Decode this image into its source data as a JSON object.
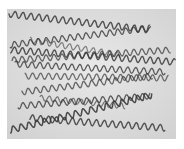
{
  "image": {
    "width": 184,
    "height": 149,
    "background": "#ffffff",
    "panel": {
      "x": 7,
      "y": 9,
      "w": 169,
      "h": 130,
      "fill": "#dcdcdc",
      "fill_light": "#e6e6e6"
    },
    "subject": "micrograph of helical spiral filaments",
    "filament_color": "#3a3a3a",
    "filaments": [
      {
        "x1": 9,
        "y1": 14,
        "x2": 150,
        "y2": 30,
        "amp": 3.2,
        "wavelength": 8,
        "width": 1.4,
        "opacity": 0.85
      },
      {
        "x1": 10,
        "y1": 45,
        "x2": 150,
        "y2": 28,
        "amp": 3.0,
        "wavelength": 8,
        "width": 1.3,
        "opacity": 0.8
      },
      {
        "x1": 11,
        "y1": 50,
        "x2": 175,
        "y2": 62,
        "amp": 3.2,
        "wavelength": 8,
        "width": 1.4,
        "opacity": 0.85
      },
      {
        "x1": 12,
        "y1": 60,
        "x2": 170,
        "y2": 50,
        "amp": 3.0,
        "wavelength": 8,
        "width": 1.3,
        "opacity": 0.75
      },
      {
        "x1": 15,
        "y1": 64,
        "x2": 165,
        "y2": 72,
        "amp": 3.0,
        "wavelength": 8,
        "width": 1.3,
        "opacity": 0.8
      },
      {
        "x1": 25,
        "y1": 76,
        "x2": 168,
        "y2": 78,
        "amp": 3.0,
        "wavelength": 8,
        "width": 1.3,
        "opacity": 0.7
      },
      {
        "x1": 22,
        "y1": 92,
        "x2": 152,
        "y2": 76,
        "amp": 3.0,
        "wavelength": 8,
        "width": 1.3,
        "opacity": 0.75
      },
      {
        "x1": 18,
        "y1": 106,
        "x2": 150,
        "y2": 96,
        "amp": 3.0,
        "wavelength": 8,
        "width": 1.3,
        "opacity": 0.8
      },
      {
        "x1": 10,
        "y1": 130,
        "x2": 152,
        "y2": 95,
        "amp": 3.2,
        "wavelength": 8,
        "width": 1.5,
        "opacity": 0.9
      },
      {
        "x1": 30,
        "y1": 118,
        "x2": 165,
        "y2": 128,
        "amp": 3.2,
        "wavelength": 8,
        "width": 1.4,
        "opacity": 0.85
      },
      {
        "x1": 40,
        "y1": 98,
        "x2": 125,
        "y2": 106,
        "amp": 2.8,
        "wavelength": 8,
        "width": 1.2,
        "opacity": 0.65
      },
      {
        "x1": 30,
        "y1": 40,
        "x2": 120,
        "y2": 55,
        "amp": 2.8,
        "wavelength": 8,
        "width": 1.2,
        "opacity": 0.6
      }
    ]
  }
}
